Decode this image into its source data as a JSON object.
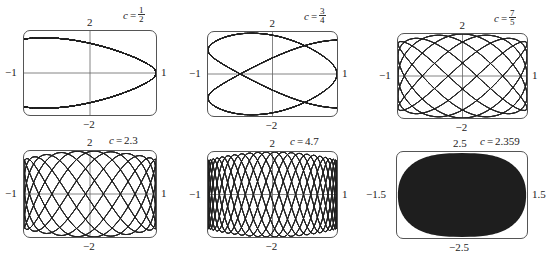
{
  "chart_data": [
    {
      "type": "line",
      "title": "c = 1/2",
      "c_label": "c",
      "c_num": "1",
      "c_den": "2",
      "c": 0.5,
      "xlim": [
        -1,
        1
      ],
      "ylim": [
        -2,
        2
      ],
      "tick_labels": {
        "top": "2",
        "bottom": "−2",
        "left": "−1",
        "right": "1"
      },
      "grid": false,
      "axes": "crosshair"
    },
    {
      "type": "line",
      "title": "c = 3/4",
      "c_label": "c",
      "c_num": "3",
      "c_den": "4",
      "c": 0.75,
      "xlim": [
        -1,
        1
      ],
      "ylim": [
        -2,
        2
      ],
      "tick_labels": {
        "top": "2",
        "bottom": "−2",
        "left": "−1",
        "right": "1"
      },
      "grid": false,
      "axes": "crosshair"
    },
    {
      "type": "line",
      "title": "c = 7/5",
      "c_label": "c",
      "c_num": "7",
      "c_den": "5",
      "c": 1.4,
      "xlim": [
        -1,
        1
      ],
      "ylim": [
        -2,
        2
      ],
      "tick_labels": {
        "top": "2",
        "bottom": "−2",
        "left": "−1",
        "right": "1"
      },
      "grid": false,
      "axes": "crosshair"
    },
    {
      "type": "line",
      "title": "c = 2.3",
      "c_label": "c",
      "c_value": "2.3",
      "c": 2.3,
      "xlim": [
        -1,
        1
      ],
      "ylim": [
        -2,
        2
      ],
      "tick_labels": {
        "top": "2",
        "bottom": "−2",
        "left": "−1",
        "right": "1"
      },
      "grid": false,
      "axes": "crosshair"
    },
    {
      "type": "line",
      "title": "c = 4.7",
      "c_label": "c",
      "c_value": "4.7",
      "c": 4.7,
      "xlim": [
        -1,
        1
      ],
      "ylim": [
        -2,
        2
      ],
      "tick_labels": {
        "top": "2",
        "bottom": "−2",
        "left": "−1",
        "right": "1"
      },
      "grid": false,
      "axes": "crosshair"
    },
    {
      "type": "area",
      "title": "c = 2.359",
      "c_label": "c",
      "c_value": "2.359",
      "c": 2.359,
      "xlim": [
        -1.5,
        1.5
      ],
      "ylim": [
        -2.5,
        2.5
      ],
      "tick_labels": {
        "top": "2.5",
        "bottom": "−2.5",
        "left": "−1.5",
        "right": "1.5"
      },
      "grid": false,
      "axes": "none",
      "filled": true
    }
  ],
  "colors": {
    "curve": "#222222",
    "frame": "#555555",
    "fill": "#1e1e1e",
    "background": "#ffffff"
  }
}
